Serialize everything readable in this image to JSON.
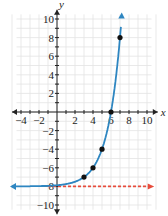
{
  "chart_data": {
    "type": "line",
    "title": "",
    "xlabel": "x",
    "ylabel": "y",
    "xlim": [
      -5,
      11
    ],
    "ylim": [
      -11,
      11
    ],
    "grid": true,
    "x_ticks": [
      -4,
      -2,
      2,
      4,
      6,
      8,
      10
    ],
    "y_ticks": [
      10,
      8,
      6,
      4,
      2,
      -2,
      -4,
      -6,
      -8,
      -10
    ],
    "function": "y = 2^(x-3) - 8",
    "series": [
      {
        "name": "curve",
        "color": "#2e86c1",
        "points": [
          [
            3,
            -7
          ],
          [
            4,
            -6
          ],
          [
            5,
            -4
          ],
          [
            6,
            0
          ],
          [
            7,
            8
          ]
        ]
      },
      {
        "name": "asymptote",
        "color": "#e74c3c",
        "style": "dashed",
        "y": -8
      }
    ]
  },
  "labels": {
    "x": "x",
    "y": "y"
  }
}
